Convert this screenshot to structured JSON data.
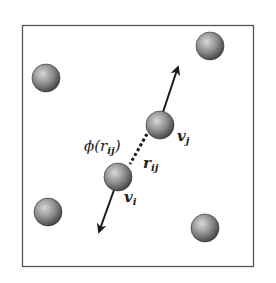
{
  "figure": {
    "box": {
      "x": 22,
      "y": 25,
      "width": 232,
      "height": 242,
      "stroke": "#555555"
    },
    "particle_color_light": "#cfcfcf",
    "particle_color_dark": "#4a4a4a",
    "particles": [
      {
        "id": "top-left",
        "cx": 46,
        "cy": 78,
        "r": 14
      },
      {
        "id": "top-right",
        "cx": 210,
        "cy": 46,
        "r": 14
      },
      {
        "id": "bottom-left",
        "cx": 48,
        "cy": 212,
        "r": 14
      },
      {
        "id": "bottom-right",
        "cx": 205,
        "cy": 228,
        "r": 14
      },
      {
        "id": "particle-j",
        "cx": 160,
        "cy": 125,
        "r": 14
      },
      {
        "id": "particle-i",
        "cx": 118,
        "cy": 177,
        "r": 14
      }
    ],
    "labels": {
      "potential": "ϕ(r",
      "potential_sub": "ij",
      "potential_close": ")",
      "distance": "r",
      "distance_sub": "ij",
      "velocity_j": "v",
      "velocity_j_sub": "j",
      "velocity_i": "v",
      "velocity_i_sub": "i"
    },
    "arrows": [
      {
        "id": "velocity-j-arrow",
        "from": [
          163,
          112
        ],
        "to": [
          178,
          66
        ]
      },
      {
        "id": "velocity-i-arrow",
        "from": [
          113,
          190
        ],
        "to": [
          98,
          233
        ]
      }
    ],
    "bond": {
      "from": [
        146,
        135
      ],
      "to": [
        130,
        164
      ],
      "style": "dashed"
    }
  }
}
